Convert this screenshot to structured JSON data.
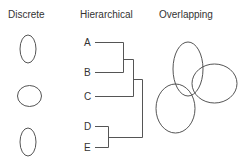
{
  "titles": {
    "discrete": "Discrete",
    "hierarchical": "Hierarchical",
    "overlapping": "Overlapping"
  },
  "hierarchical": {
    "leaves": [
      "A",
      "B",
      "C",
      "D",
      "E"
    ],
    "structure": "(((A,B),C),(D,E))"
  },
  "discrete": {
    "count": 3
  },
  "overlapping": {
    "count": 3
  },
  "colors": {
    "line": "#555555",
    "text": "#333333",
    "background": "#ffffff"
  }
}
